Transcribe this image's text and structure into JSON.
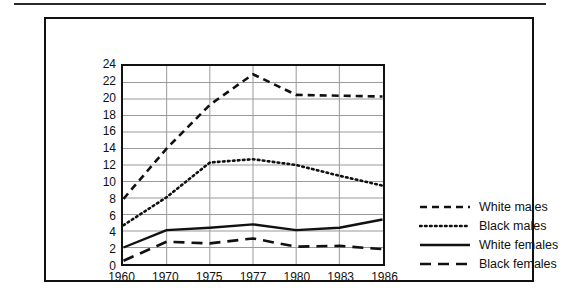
{
  "chart_data": {
    "type": "line",
    "title": "",
    "xlabel": "",
    "ylabel": "",
    "x": [
      1960,
      1970,
      1975,
      1977,
      1980,
      1983,
      1986
    ],
    "categories": [
      "1960",
      "1970",
      "1975",
      "1977",
      "1980",
      "1983",
      "1986"
    ],
    "xlim": [
      1960,
      1986
    ],
    "ylim": [
      0,
      24
    ],
    "y_ticks": [
      24,
      22,
      20,
      18,
      16,
      14,
      12,
      10,
      8,
      6,
      4,
      2,
      0
    ],
    "grid": "horizontal-and-vertical",
    "legend_position": "right",
    "series": [
      {
        "name": "White males",
        "style": "dashed",
        "color": "#111111",
        "values": [
          7.9,
          14.0,
          19.3,
          23.0,
          20.5,
          20.4,
          20.3
        ]
      },
      {
        "name": "Black males",
        "style": "dotted",
        "color": "#111111",
        "values": [
          4.7,
          8.1,
          12.3,
          12.7,
          12.0,
          10.7,
          9.5
        ]
      },
      {
        "name": "White females",
        "style": "solid",
        "color": "#111111",
        "values": [
          2.0,
          4.1,
          4.4,
          4.8,
          4.1,
          4.4,
          5.4
        ]
      },
      {
        "name": "Black females",
        "style": "long-dashed",
        "color": "#111111",
        "values": [
          0.4,
          2.7,
          2.5,
          3.1,
          2.1,
          2.2,
          1.8
        ]
      }
    ]
  },
  "axes": {
    "y_tick_labels": [
      "24",
      "22",
      "20",
      "18",
      "16",
      "14",
      "12",
      "10",
      "8",
      "6",
      "4",
      "2",
      "0"
    ],
    "x_tick_labels": [
      "1960",
      "1970",
      "1975",
      "1977",
      "1980",
      "1983",
      "1986"
    ]
  },
  "legend": {
    "items": [
      {
        "label": "White males",
        "style": "dashed"
      },
      {
        "label": "Black males",
        "style": "dotted"
      },
      {
        "label": "White females",
        "style": "solid"
      },
      {
        "label": "Black females",
        "style": "long-dashed"
      }
    ]
  },
  "colors": {
    "ink": "#111111",
    "grid": "#9a9a9a",
    "background": "#ffffff"
  }
}
